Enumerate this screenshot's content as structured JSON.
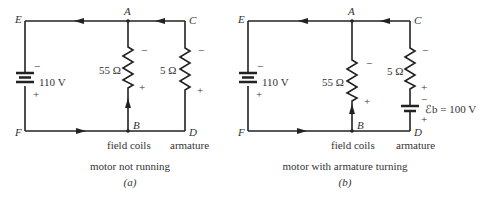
{
  "figures": [
    {
      "id": "a",
      "caption": "motor not running",
      "sublabel": "(a)",
      "nodes": {
        "E": "E",
        "A": "A",
        "C": "C",
        "F": "F",
        "B": "B",
        "D": "D"
      },
      "source": {
        "value": "110 V",
        "minus": "−",
        "plus": "+"
      },
      "field_resistor": {
        "value": "55 Ω",
        "minus": "−",
        "plus": "+"
      },
      "armature_resistor": {
        "value": "5 Ω",
        "minus": "−",
        "plus": "+"
      },
      "labels": {
        "field": "field coils",
        "armature": "armature"
      }
    },
    {
      "id": "b",
      "caption": "motor with armature turning",
      "sublabel": "(b)",
      "nodes": {
        "E": "E",
        "A": "A",
        "C": "C",
        "F": "F",
        "B": "B",
        "D": "D"
      },
      "source": {
        "value": "110 V",
        "minus": "−",
        "plus": "+"
      },
      "field_resistor": {
        "value": "55 Ω",
        "minus": "−",
        "plus": "+"
      },
      "armature_resistor": {
        "value": "5 Ω",
        "minus": "−",
        "plus": "+"
      },
      "back_emf": {
        "value": "ℰb = 100 V",
        "minus": "−",
        "plus": "+"
      },
      "labels": {
        "field": "field coils",
        "armature": "armature"
      }
    }
  ],
  "colors": {
    "wire": "#222222",
    "text": "#333333",
    "background": "#ffffff"
  }
}
